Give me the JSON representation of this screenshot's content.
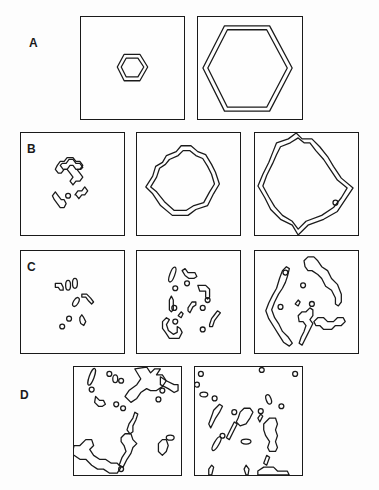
{
  "figure": {
    "rows": [
      {
        "label": "A",
        "panels": 2,
        "description": "Regular hexagonal double-line outlines: small then large"
      },
      {
        "label": "B",
        "panels": 3,
        "description": "Irregular hexagonal clusters growing in size"
      },
      {
        "label": "C",
        "panels": 3,
        "description": "Fragmented clusters growing into roughly hexagonal patch"
      },
      {
        "label": "D",
        "panels": 2,
        "description": "Scattered irregular fragments across whole field"
      }
    ]
  }
}
